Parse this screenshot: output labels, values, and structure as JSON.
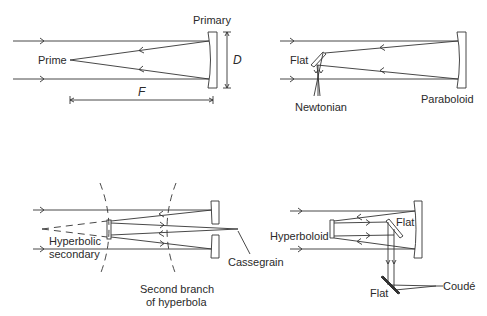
{
  "diagram": {
    "panels": [
      {
        "id": "prime-focus",
        "labels": {
          "primary": "Primary",
          "prime": "Prime",
          "diameter": "D",
          "focal_length": "F"
        }
      },
      {
        "id": "newtonian",
        "labels": {
          "flat": "Flat",
          "newtonian": "Newtonian",
          "paraboloid": "Paraboloid"
        }
      },
      {
        "id": "cassegrain",
        "labels": {
          "hyperbolic_line1": "Hyperbolic",
          "hyperbolic_line2": "secondary",
          "cassegrain": "Cassegrain",
          "branch_line1": "Second branch",
          "branch_line2": "of hyperbola"
        }
      },
      {
        "id": "coude",
        "labels": {
          "hyperboloid": "Hyperboloid",
          "flat_upper": "Flat",
          "flat_lower": "Flat",
          "coude": "Coudé"
        }
      }
    ]
  }
}
